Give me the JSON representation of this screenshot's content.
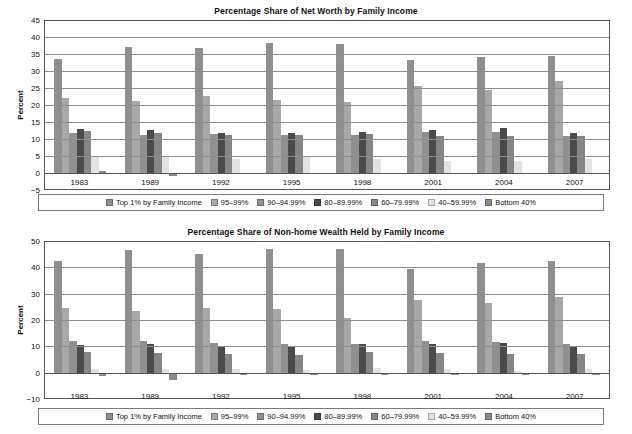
{
  "series_colors": [
    "#8f8f8f",
    "#a8a8a8",
    "#909090",
    "#4a4a4a",
    "#868686",
    "#e2e2e2",
    "#8a8a8a"
  ],
  "legend": {
    "items": [
      {
        "label": "Top 1% by Family Income"
      },
      {
        "label": "95–99%"
      },
      {
        "label": "90–94.99%"
      },
      {
        "label": "80–89.99%"
      },
      {
        "label": "60–79.99%"
      },
      {
        "label": "40–59.99%"
      },
      {
        "label": "Bottom 40%"
      }
    ]
  },
  "chart_data": [
    {
      "id": "net-worth",
      "type": "bar",
      "title": "Percentage Share of Net Worth by Family Income",
      "xlabel": "",
      "ylabel": "Percent",
      "ylim": [
        -5,
        45
      ],
      "yticks": [
        45,
        40,
        35,
        30,
        25,
        20,
        15,
        10,
        5,
        0,
        -5
      ],
      "grid": true,
      "legend_position": "bottom",
      "categories": [
        "1983",
        "1989",
        "1992",
        "1995",
        "1998",
        "2001",
        "2004",
        "2007"
      ],
      "series": [
        {
          "name": "Top 1% by Family Income",
          "values": [
            33.8,
            37.4,
            37.2,
            38.5,
            38.1,
            33.4,
            34.3,
            34.6
          ]
        },
        {
          "name": "95–99%",
          "values": [
            22.3,
            21.6,
            22.8,
            21.8,
            21.3,
            25.8,
            24.6,
            27.3
          ]
        },
        {
          "name": "90–94.99%",
          "values": [
            12.1,
            11.6,
            11.8,
            11.5,
            11.5,
            12.3,
            12.3,
            11.2
          ]
        },
        {
          "name": "80–89.99%",
          "values": [
            13.1,
            13.0,
            12.0,
            12.1,
            12.5,
            13.0,
            13.4,
            12.0
          ]
        },
        {
          "name": "60–79.99%",
          "values": [
            12.6,
            12.0,
            11.5,
            11.4,
            11.9,
            11.3,
            11.3,
            11.2
          ]
        },
        {
          "name": "40–59.99%",
          "values": [
            5.2,
            5.3,
            4.5,
            5.0,
            4.5,
            3.9,
            3.8,
            4.5
          ]
        },
        {
          "name": "Bottom 40%",
          "values": [
            0.9,
            -0.7,
            0.4,
            0.2,
            0.2,
            0.3,
            0.2,
            0.2
          ]
        }
      ]
    },
    {
      "id": "non-home-wealth",
      "type": "bar",
      "title": "Percentage Share of Non-home Wealth Held by Family Income",
      "xlabel": "",
      "ylabel": "Percent",
      "ylim": [
        -10,
        50
      ],
      "yticks": [
        50,
        40,
        30,
        20,
        10,
        0,
        -10
      ],
      "grid": true,
      "legend_position": "bottom",
      "categories": [
        "1983",
        "1989",
        "1992",
        "1995",
        "1998",
        "2001",
        "2004",
        "2007"
      ],
      "series": [
        {
          "name": "Top 1% by Family Income",
          "values": [
            42.9,
            46.9,
            45.6,
            47.2,
            47.3,
            39.7,
            42.2,
            42.7
          ]
        },
        {
          "name": "95–99%",
          "values": [
            25.1,
            23.9,
            25.0,
            24.6,
            21.0,
            27.8,
            26.7,
            29.3
          ]
        },
        {
          "name": "90–94.99%",
          "values": [
            12.3,
            12.5,
            11.5,
            11.3,
            11.4,
            12.3,
            12.0,
            11.3
          ]
        },
        {
          "name": "80–89.99%",
          "values": [
            11.0,
            11.1,
            10.2,
            10.1,
            11.2,
            11.4,
            11.6,
            10.2
          ]
        },
        {
          "name": "60–79.99%",
          "values": [
            8.1,
            7.8,
            7.6,
            7.1,
            8.3,
            8.0,
            7.5,
            7.3
          ]
        },
        {
          "name": "40–59.99%",
          "values": [
            1.8,
            1.6,
            1.7,
            1.3,
            2.0,
            1.8,
            1.2,
            1.6
          ]
        },
        {
          "name": "Bottom 40%",
          "values": [
            -0.9,
            -2.5,
            -0.6,
            -0.7,
            -0.4,
            -0.4,
            -0.6,
            -0.5
          ]
        }
      ]
    }
  ]
}
